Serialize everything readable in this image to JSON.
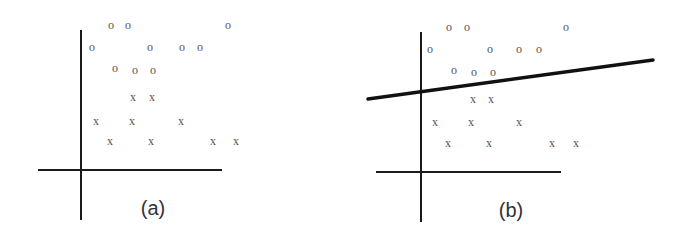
{
  "panels": [
    {
      "id": "a",
      "label": "(a)",
      "axes": {
        "x_axis": {
          "x1": 38,
          "x2": 222,
          "y": 170
        },
        "y_axis": {
          "x": 81,
          "y1": 30,
          "y2": 220
        }
      },
      "label_pos": {
        "x": 153,
        "y": 215
      },
      "class_o": {
        "marker": "o",
        "points": [
          [
            111,
            25
          ],
          [
            128,
            25
          ],
          [
            228,
            25
          ],
          [
            92,
            47
          ],
          [
            150,
            47
          ],
          [
            182,
            47
          ],
          [
            200,
            47
          ],
          [
            115,
            68
          ],
          [
            135,
            70
          ],
          [
            153,
            70
          ]
        ]
      },
      "class_x": {
        "marker": "x",
        "points": [
          [
            133,
            97
          ],
          [
            152,
            97
          ],
          [
            96,
            121
          ],
          [
            132,
            121
          ],
          [
            181,
            121
          ],
          [
            110,
            141
          ],
          [
            151,
            141
          ],
          [
            213,
            141
          ],
          [
            236,
            141
          ]
        ]
      }
    },
    {
      "id": "b",
      "label": "(b)",
      "axes": {
        "x_axis": {
          "x1": 376,
          "x2": 561,
          "y": 172
        },
        "y_axis": {
          "x": 421,
          "y1": 32,
          "y2": 222
        }
      },
      "label_pos": {
        "x": 511,
        "y": 217
      },
      "separator_line": {
        "x1": 368,
        "y1": 99,
        "x2": 653,
        "y2": 60
      },
      "class_o": {
        "marker": "o",
        "points": [
          [
            449,
            27
          ],
          [
            467,
            27
          ],
          [
            566,
            27
          ],
          [
            430,
            49
          ],
          [
            490,
            49
          ],
          [
            519,
            49
          ],
          [
            539,
            49
          ],
          [
            454,
            70
          ],
          [
            474,
            72
          ],
          [
            493,
            72
          ]
        ]
      },
      "class_x": {
        "marker": "x",
        "points": [
          [
            473,
            99
          ],
          [
            491,
            99
          ],
          [
            435,
            122
          ],
          [
            471,
            122
          ],
          [
            519,
            122
          ],
          [
            448,
            143
          ],
          [
            489,
            143
          ],
          [
            552,
            143
          ],
          [
            576,
            143
          ]
        ]
      }
    }
  ],
  "colors": {
    "axis": "#1a1a1a",
    "separator": "#111111",
    "marker": "#555555",
    "label": "#333333"
  }
}
